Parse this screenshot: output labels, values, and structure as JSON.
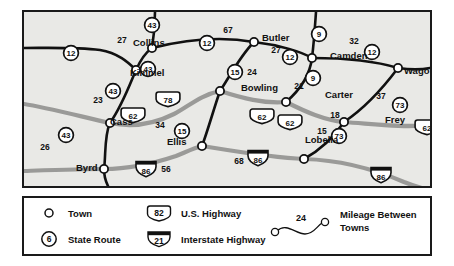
{
  "map": {
    "background_color": "#e9e9e6",
    "border_color": "#1a1a1a",
    "black_road_color": "#111111",
    "gray_road_color": "#9a9a98",
    "towns": [
      {
        "name": "Collins",
        "x": 133,
        "y": 46
      },
      {
        "name": "Butler",
        "x": 262,
        "y": 41
      },
      {
        "name": "Camden",
        "x": 330,
        "y": 59
      },
      {
        "name": "Wago",
        "x": 404,
        "y": 74
      },
      {
        "name": "Kimmel",
        "x": 130,
        "y": 76
      },
      {
        "name": "Bowling",
        "x": 241,
        "y": 91
      },
      {
        "name": "Carter",
        "x": 325,
        "y": 98
      },
      {
        "name": "Frey",
        "x": 385,
        "y": 123
      },
      {
        "name": "Cass",
        "x": 110,
        "y": 125
      },
      {
        "name": "Ellis",
        "x": 167,
        "y": 145
      },
      {
        "name": "Lobelia",
        "x": 305,
        "y": 143
      },
      {
        "name": "Byrd",
        "x": 76,
        "y": 171
      }
    ],
    "route_shields": [
      {
        "number": "43",
        "type": "state",
        "x": 152,
        "y": 25
      },
      {
        "number": "12",
        "type": "state",
        "x": 207,
        "y": 43
      },
      {
        "number": "9",
        "type": "state",
        "x": 319,
        "y": 34
      },
      {
        "number": "12",
        "type": "state",
        "x": 372,
        "y": 52
      },
      {
        "number": "12",
        "type": "state",
        "x": 290,
        "y": 57
      },
      {
        "number": "12",
        "type": "state",
        "x": 71,
        "y": 53
      },
      {
        "number": "43",
        "type": "state",
        "x": 148,
        "y": 69
      },
      {
        "number": "15",
        "type": "state",
        "x": 235,
        "y": 72
      },
      {
        "number": "9",
        "type": "state",
        "x": 313,
        "y": 78
      },
      {
        "number": "43",
        "type": "state",
        "x": 113,
        "y": 91
      },
      {
        "number": "73",
        "type": "state",
        "x": 400,
        "y": 105
      },
      {
        "number": "15",
        "type": "state",
        "x": 182,
        "y": 131
      },
      {
        "number": "73",
        "type": "state",
        "x": 339,
        "y": 136
      },
      {
        "number": "43",
        "type": "state",
        "x": 66,
        "y": 135
      },
      {
        "number": "78",
        "type": "us",
        "x": 168,
        "y": 100
      },
      {
        "number": "62",
        "type": "us",
        "x": 133,
        "y": 116
      },
      {
        "number": "62",
        "type": "us",
        "x": 262,
        "y": 117
      },
      {
        "number": "62",
        "type": "us",
        "x": 290,
        "y": 123
      },
      {
        "number": "62",
        "type": "us",
        "x": 427,
        "y": 128
      },
      {
        "number": "86",
        "type": "interstate",
        "x": 146,
        "y": 170
      },
      {
        "number": "86",
        "type": "interstate",
        "x": 258,
        "y": 159
      },
      {
        "number": "86",
        "type": "interstate",
        "x": 381,
        "y": 176
      }
    ],
    "mileage_labels": [
      {
        "value": "27",
        "x": 122,
        "y": 43
      },
      {
        "value": "67",
        "x": 228,
        "y": 33
      },
      {
        "value": "27",
        "x": 276,
        "y": 53
      },
      {
        "value": "32",
        "x": 354,
        "y": 44
      },
      {
        "value": "24",
        "x": 252,
        "y": 75
      },
      {
        "value": "21",
        "x": 299,
        "y": 89
      },
      {
        "value": "37",
        "x": 381,
        "y": 99
      },
      {
        "value": "23",
        "x": 98,
        "y": 103
      },
      {
        "value": "38",
        "x": 283,
        "y": 122
      },
      {
        "value": "18",
        "x": 335,
        "y": 118
      },
      {
        "value": "34",
        "x": 160,
        "y": 128
      },
      {
        "value": "15",
        "x": 322,
        "y": 134
      },
      {
        "value": "26",
        "x": 45,
        "y": 150
      },
      {
        "value": "56",
        "x": 166,
        "y": 172
      },
      {
        "value": "68",
        "x": 239,
        "y": 164
      }
    ]
  },
  "legend": {
    "items": [
      {
        "symbol": "town-circle",
        "label": "Town"
      },
      {
        "symbol": "state-route-shield",
        "label": "State Route",
        "number": "6"
      },
      {
        "symbol": "us-highway-shield",
        "label": "U.S. Highway",
        "number": "82"
      },
      {
        "symbol": "interstate-shield",
        "label": "Interstate Highway",
        "number": "21"
      },
      {
        "symbol": "mileage-connector",
        "label": "Mileage Between Towns",
        "number": "24"
      }
    ]
  }
}
